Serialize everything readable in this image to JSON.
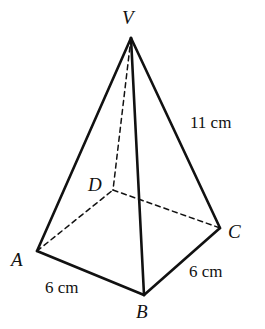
{
  "figure": {
    "kind": "square-pyramid-geometry-diagram",
    "background_color": "#ffffff",
    "stroke_color": "#111111",
    "solid_stroke_width": 2.6,
    "dashed_stroke_width": 1.5,
    "dash_pattern": "5,4"
  },
  "vertices": {
    "V": {
      "label": "V",
      "x": 131,
      "y": 38,
      "hidden": false
    },
    "A": {
      "label": "A",
      "x": 37,
      "y": 251,
      "hidden": false
    },
    "B": {
      "label": "B",
      "x": 144,
      "y": 295,
      "hidden": false
    },
    "C": {
      "label": "C",
      "x": 220,
      "y": 228,
      "hidden": false
    },
    "D": {
      "label": "D",
      "x": 113,
      "y": 190,
      "hidden": true
    }
  },
  "edges": {
    "VA": {
      "name": "edge-VA",
      "from": "V",
      "to": "A",
      "style": "solid"
    },
    "VB": {
      "name": "edge-VB",
      "from": "V",
      "to": "B",
      "style": "solid"
    },
    "VC": {
      "name": "edge-VC",
      "from": "V",
      "to": "C",
      "style": "solid"
    },
    "VD": {
      "name": "edge-VD",
      "from": "V",
      "to": "D",
      "style": "dashed"
    },
    "AB": {
      "name": "edge-AB",
      "from": "A",
      "to": "B",
      "style": "solid"
    },
    "BC": {
      "name": "edge-BC",
      "from": "B",
      "to": "C",
      "style": "solid"
    },
    "AD": {
      "name": "edge-AD",
      "from": "A",
      "to": "D",
      "style": "dashed"
    },
    "DC": {
      "name": "edge-DC",
      "from": "D",
      "to": "C",
      "style": "dashed"
    }
  },
  "measurements": {
    "slant_edge_VC": "11 cm",
    "base_edge_AB": "6 cm",
    "base_edge_BC": "6 cm"
  }
}
